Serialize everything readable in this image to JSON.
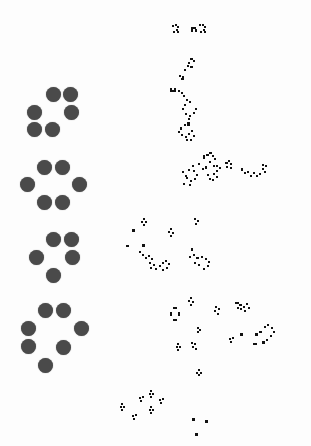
{
  "board": {
    "background": "#fdfdfd",
    "dot_color": "#4a4a4a",
    "cell_color": "#111111",
    "dot_diameter": 15
  },
  "dot_patterns": [
    {
      "name": "pattern-1",
      "dots": [
        [
          53,
          94
        ],
        [
          70,
          94
        ],
        [
          34,
          112
        ],
        [
          71,
          112
        ],
        [
          34,
          129
        ],
        [
          52,
          129
        ]
      ]
    },
    {
      "name": "pattern-2",
      "dots": [
        [
          44,
          167
        ],
        [
          62,
          167
        ],
        [
          27,
          184
        ],
        [
          79,
          184
        ],
        [
          44,
          202
        ],
        [
          62,
          202
        ]
      ]
    },
    {
      "name": "pattern-3",
      "dots": [
        [
          53,
          239
        ],
        [
          71,
          239
        ],
        [
          36,
          257
        ],
        [
          72,
          257
        ],
        [
          53,
          275
        ]
      ]
    },
    {
      "name": "pattern-4",
      "dots": [
        [
          45,
          310
        ],
        [
          63,
          310
        ],
        [
          28,
          328
        ],
        [
          81,
          328
        ],
        [
          28,
          346
        ],
        [
          63,
          347
        ],
        [
          45,
          365
        ]
      ]
    }
  ],
  "cell_clusters": [
    {
      "name": "evolution-1-top",
      "cells": [
        [
          172,
          25,
          2,
          2
        ],
        [
          175,
          24,
          2,
          2
        ],
        [
          177,
          26,
          2,
          2
        ],
        [
          176,
          29,
          2,
          2
        ],
        [
          173,
          31,
          2,
          2
        ],
        [
          177,
          31,
          2,
          2
        ],
        [
          191,
          27,
          2,
          5
        ],
        [
          193,
          27,
          3,
          2
        ],
        [
          195,
          29,
          2,
          3
        ],
        [
          199,
          24,
          2,
          2
        ],
        [
          202,
          24,
          2,
          2
        ],
        [
          204,
          26,
          2,
          2
        ],
        [
          203,
          29,
          2,
          2
        ],
        [
          200,
          31,
          2,
          2
        ],
        [
          204,
          31,
          2,
          2
        ]
      ]
    },
    {
      "name": "evolution-1-body",
      "cells": [
        [
          190,
          58,
          3,
          2
        ],
        [
          193,
          60,
          2,
          2
        ],
        [
          188,
          62,
          2,
          2
        ],
        [
          187,
          65,
          2,
          2
        ],
        [
          190,
          66,
          3,
          2
        ],
        [
          184,
          69,
          2,
          2
        ],
        [
          179,
          75,
          2,
          2
        ],
        [
          182,
          76,
          2,
          2
        ],
        [
          181,
          78,
          3,
          2
        ],
        [
          170,
          88,
          2,
          4
        ],
        [
          172,
          90,
          2,
          2
        ],
        [
          174,
          88,
          2,
          4
        ],
        [
          178,
          90,
          2,
          2
        ],
        [
          181,
          92,
          2,
          2
        ],
        [
          183,
          95,
          2,
          2
        ],
        [
          186,
          99,
          2,
          2
        ],
        [
          189,
          101,
          2,
          2
        ],
        [
          184,
          104,
          2,
          2
        ],
        [
          182,
          108,
          2,
          2
        ],
        [
          185,
          113,
          2,
          2
        ],
        [
          189,
          115,
          2,
          2
        ],
        [
          193,
          112,
          2,
          2
        ],
        [
          195,
          108,
          2,
          2
        ],
        [
          188,
          118,
          2,
          2
        ],
        [
          187,
          122,
          3,
          4
        ],
        [
          184,
          124,
          2,
          2
        ],
        [
          180,
          127,
          2,
          3
        ],
        [
          178,
          131,
          2,
          2
        ],
        [
          181,
          134,
          2,
          2
        ],
        [
          185,
          136,
          2,
          2
        ],
        [
          188,
          133,
          2,
          2
        ],
        [
          191,
          130,
          2,
          2
        ],
        [
          193,
          135,
          2,
          2
        ],
        [
          190,
          139,
          2,
          2
        ],
        [
          186,
          139,
          2,
          2
        ]
      ]
    },
    {
      "name": "evolution-2",
      "cells": [
        [
          182,
          171,
          2,
          2
        ],
        [
          185,
          175,
          2,
          2
        ],
        [
          188,
          169,
          2,
          2
        ],
        [
          192,
          165,
          2,
          2
        ],
        [
          193,
          170,
          2,
          2
        ],
        [
          196,
          174,
          2,
          2
        ],
        [
          194,
          178,
          2,
          2
        ],
        [
          190,
          180,
          2,
          2
        ],
        [
          186,
          177,
          2,
          2
        ],
        [
          189,
          184,
          2,
          2
        ],
        [
          183,
          183,
          2,
          2
        ],
        [
          203,
          155,
          2,
          4
        ],
        [
          206,
          154,
          3,
          2
        ],
        [
          209,
          152,
          3,
          2
        ],
        [
          212,
          155,
          2,
          2
        ],
        [
          214,
          158,
          2,
          2
        ],
        [
          209,
          161,
          2,
          2
        ],
        [
          198,
          163,
          2,
          2
        ],
        [
          202,
          168,
          2,
          2
        ],
        [
          205,
          166,
          2,
          3
        ],
        [
          213,
          165,
          2,
          2
        ],
        [
          216,
          165,
          2,
          2
        ],
        [
          219,
          167,
          2,
          2
        ],
        [
          216,
          170,
          2,
          2
        ],
        [
          213,
          173,
          2,
          2
        ],
        [
          216,
          176,
          2,
          2
        ],
        [
          207,
          174,
          2,
          2
        ],
        [
          209,
          178,
          2,
          2
        ],
        [
          212,
          179,
          2,
          2
        ],
        [
          225,
          162,
          3,
          2
        ],
        [
          228,
          160,
          2,
          2
        ],
        [
          230,
          163,
          2,
          2
        ],
        [
          226,
          166,
          2,
          2
        ],
        [
          230,
          167,
          2,
          2
        ],
        [
          241,
          168,
          2,
          3
        ],
        [
          244,
          172,
          2,
          2
        ],
        [
          247,
          171,
          2,
          2
        ],
        [
          250,
          175,
          2,
          2
        ],
        [
          253,
          172,
          2,
          2
        ],
        [
          256,
          175,
          2,
          2
        ],
        [
          259,
          173,
          2,
          2
        ],
        [
          262,
          168,
          2,
          2
        ],
        [
          264,
          171,
          2,
          2
        ],
        [
          265,
          165,
          2,
          2
        ],
        [
          262,
          164,
          2,
          2
        ]
      ]
    },
    {
      "name": "evolution-3",
      "cells": [
        [
          143,
          218,
          2,
          2
        ],
        [
          141,
          221,
          2,
          2
        ],
        [
          145,
          221,
          2,
          2
        ],
        [
          143,
          224,
          2,
          2
        ],
        [
          132,
          229,
          3,
          3
        ],
        [
          126,
          245,
          3,
          2
        ],
        [
          142,
          244,
          3,
          3
        ],
        [
          139,
          251,
          2,
          2
        ],
        [
          142,
          254,
          2,
          2
        ],
        [
          145,
          257,
          2,
          2
        ],
        [
          148,
          255,
          2,
          2
        ],
        [
          151,
          258,
          2,
          2
        ],
        [
          149,
          262,
          2,
          2
        ],
        [
          153,
          264,
          2,
          2
        ],
        [
          155,
          268,
          2,
          2
        ],
        [
          150,
          267,
          2,
          2
        ],
        [
          159,
          265,
          2,
          2
        ],
        [
          162,
          262,
          2,
          2
        ],
        [
          165,
          260,
          2,
          2
        ],
        [
          168,
          263,
          2,
          2
        ],
        [
          166,
          267,
          2,
          2
        ],
        [
          162,
          269,
          2,
          2
        ],
        [
          170,
          228,
          2,
          2
        ],
        [
          168,
          231,
          2,
          2
        ],
        [
          172,
          232,
          2,
          2
        ],
        [
          170,
          235,
          2,
          2
        ],
        [
          194,
          218,
          2,
          2
        ],
        [
          197,
          220,
          2,
          2
        ],
        [
          195,
          223,
          2,
          2
        ],
        [
          191,
          248,
          2,
          3
        ],
        [
          193,
          254,
          2,
          2
        ],
        [
          189,
          256,
          2,
          2
        ],
        [
          196,
          257,
          3,
          2
        ],
        [
          201,
          256,
          2,
          2
        ],
        [
          205,
          258,
          2,
          2
        ],
        [
          208,
          261,
          2,
          2
        ],
        [
          207,
          265,
          2,
          2
        ],
        [
          203,
          268,
          2,
          2
        ],
        [
          198,
          264,
          2,
          2
        ],
        [
          194,
          262,
          2,
          2
        ]
      ]
    },
    {
      "name": "evolution-4",
      "cells": [
        [
          190,
          297,
          2,
          2
        ],
        [
          188,
          300,
          2,
          2
        ],
        [
          192,
          301,
          2,
          2
        ],
        [
          190,
          304,
          2,
          2
        ],
        [
          173,
          307,
          4,
          2
        ],
        [
          170,
          312,
          2,
          4
        ],
        [
          178,
          312,
          2,
          4
        ],
        [
          173,
          319,
          4,
          2
        ],
        [
          215,
          306,
          2,
          2
        ],
        [
          218,
          308,
          2,
          2
        ],
        [
          214,
          310,
          2,
          2
        ],
        [
          217,
          313,
          2,
          2
        ],
        [
          235,
          302,
          4,
          2
        ],
        [
          239,
          304,
          3,
          2
        ],
        [
          243,
          306,
          2,
          2
        ],
        [
          246,
          303,
          2,
          2
        ],
        [
          248,
          307,
          2,
          2
        ],
        [
          244,
          310,
          2,
          2
        ],
        [
          240,
          308,
          2,
          2
        ],
        [
          237,
          307,
          2,
          2
        ],
        [
          197,
          327,
          2,
          2
        ],
        [
          199,
          329,
          2,
          2
        ],
        [
          197,
          331,
          2,
          2
        ],
        [
          177,
          343,
          2,
          2
        ],
        [
          176,
          346,
          2,
          2
        ],
        [
          179,
          346,
          2,
          2
        ],
        [
          177,
          349,
          2,
          2
        ],
        [
          191,
          342,
          2,
          2
        ],
        [
          194,
          343,
          2,
          2
        ],
        [
          192,
          346,
          2,
          2
        ],
        [
          195,
          348,
          2,
          2
        ],
        [
          229,
          338,
          2,
          2
        ],
        [
          232,
          337,
          2,
          2
        ],
        [
          230,
          341,
          2,
          2
        ],
        [
          240,
          333,
          3,
          3
        ],
        [
          255,
          333,
          3,
          3
        ],
        [
          259,
          331,
          3,
          2
        ],
        [
          264,
          326,
          2,
          2
        ],
        [
          267,
          324,
          2,
          2
        ],
        [
          271,
          327,
          2,
          2
        ],
        [
          273,
          331,
          2,
          2
        ],
        [
          270,
          335,
          2,
          2
        ],
        [
          266,
          339,
          2,
          2
        ],
        [
          253,
          343,
          4,
          2
        ],
        [
          262,
          341,
          3,
          3
        ],
        [
          198,
          369,
          2,
          2
        ],
        [
          196,
          372,
          2,
          2
        ],
        [
          200,
          372,
          2,
          2
        ],
        [
          198,
          374,
          2,
          2
        ]
      ]
    },
    {
      "name": "evolution-5",
      "cells": [
        [
          150,
          390,
          2,
          2
        ],
        [
          149,
          393,
          2,
          2
        ],
        [
          152,
          393,
          2,
          2
        ],
        [
          150,
          396,
          2,
          2
        ],
        [
          139,
          397,
          2,
          2
        ],
        [
          142,
          396,
          2,
          2
        ],
        [
          140,
          400,
          2,
          2
        ],
        [
          159,
          399,
          2,
          2
        ],
        [
          162,
          398,
          2,
          2
        ],
        [
          160,
          402,
          2,
          2
        ],
        [
          150,
          406,
          2,
          2
        ],
        [
          149,
          409,
          2,
          2
        ],
        [
          152,
          409,
          2,
          2
        ],
        [
          150,
          412,
          2,
          2
        ],
        [
          121,
          403,
          2,
          2
        ],
        [
          120,
          406,
          2,
          2
        ],
        [
          123,
          406,
          2,
          2
        ],
        [
          121,
          409,
          2,
          2
        ],
        [
          132,
          415,
          2,
          2
        ],
        [
          135,
          414,
          2,
          2
        ],
        [
          133,
          418,
          2,
          2
        ],
        [
          192,
          418,
          3,
          3
        ],
        [
          205,
          420,
          3,
          3
        ],
        [
          195,
          433,
          3,
          3
        ]
      ]
    }
  ]
}
